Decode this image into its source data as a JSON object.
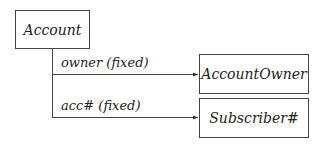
{
  "diagram": {
    "nodes": {
      "account": "Account",
      "account_owner": "AccountOwner",
      "subscriber": "Subscriber#"
    },
    "edges": [
      {
        "from": "Account",
        "to": "AccountOwner",
        "label": "owner (fixed)"
      },
      {
        "from": "Account",
        "to": "Subscriber#",
        "label": "acc# (fixed)"
      }
    ]
  }
}
